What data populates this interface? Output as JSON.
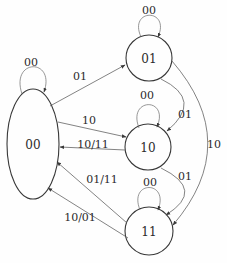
{
  "diagram": {
    "kind": "state-transition-diagram",
    "colors": {
      "background": "#fefefe",
      "node_stroke": "#383838",
      "edge_stroke": "#5a5a5a",
      "text": "#2b2b2b"
    },
    "states": [
      {
        "id": "00",
        "label": "00",
        "shape": "ellipse"
      },
      {
        "id": "01",
        "label": "01",
        "shape": "circle"
      },
      {
        "id": "10",
        "label": "10",
        "shape": "circle"
      },
      {
        "id": "11",
        "label": "11",
        "shape": "circle"
      }
    ],
    "self_loops": [
      {
        "state": "00",
        "label": "00"
      },
      {
        "state": "01",
        "label": "00"
      },
      {
        "state": "10",
        "label": "00"
      },
      {
        "state": "11",
        "label": "00"
      }
    ],
    "transitions": [
      {
        "from": "00",
        "to": "01",
        "label": "01"
      },
      {
        "from": "00",
        "to": "10",
        "label": "10"
      },
      {
        "from": "10",
        "to": "00",
        "label": "10/11"
      },
      {
        "from": "11",
        "to": "00",
        "label": "01/11"
      },
      {
        "from": "11",
        "to": "00",
        "label": "10/01"
      },
      {
        "from": "01",
        "to": "10",
        "label": "01"
      },
      {
        "from": "10",
        "to": "11",
        "label": "01"
      },
      {
        "from": "01",
        "to": "11",
        "label": "10"
      }
    ]
  }
}
